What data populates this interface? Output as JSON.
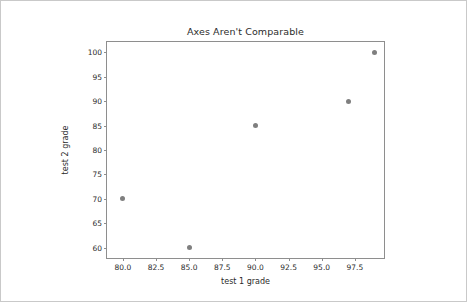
{
  "chart_data": {
    "type": "scatter",
    "title": "Axes Aren't Comparable",
    "xlabel": "test 1 grade",
    "ylabel": "test 2 grade",
    "x": [
      80,
      85,
      90,
      97,
      99
    ],
    "y": [
      70,
      60,
      85,
      90,
      100
    ],
    "points": [
      {
        "x": 80,
        "y": 70
      },
      {
        "x": 85,
        "y": 60
      },
      {
        "x": 90,
        "y": 85
      },
      {
        "x": 97,
        "y": 90
      },
      {
        "x": 99,
        "y": 100
      }
    ],
    "xlim": [
      78.8,
      99.7
    ],
    "ylim": [
      57.9,
      102.1
    ],
    "xticks": [
      80.0,
      82.5,
      85.0,
      87.5,
      90.0,
      92.5,
      95.0,
      97.5
    ],
    "xtick_labels": [
      "80.0",
      "82.5",
      "85.0",
      "87.5",
      "90.0",
      "92.5",
      "95.0",
      "97.5"
    ],
    "yticks": [
      60,
      65,
      70,
      75,
      80,
      85,
      90,
      95,
      100
    ],
    "ytick_labels": [
      "60",
      "65",
      "70",
      "75",
      "80",
      "85",
      "90",
      "95",
      "100"
    ],
    "grid": false,
    "legend": null,
    "marker_color": "#7f7f7f",
    "frame_color": "#8e8e8e",
    "background_color": "#ffffff"
  }
}
